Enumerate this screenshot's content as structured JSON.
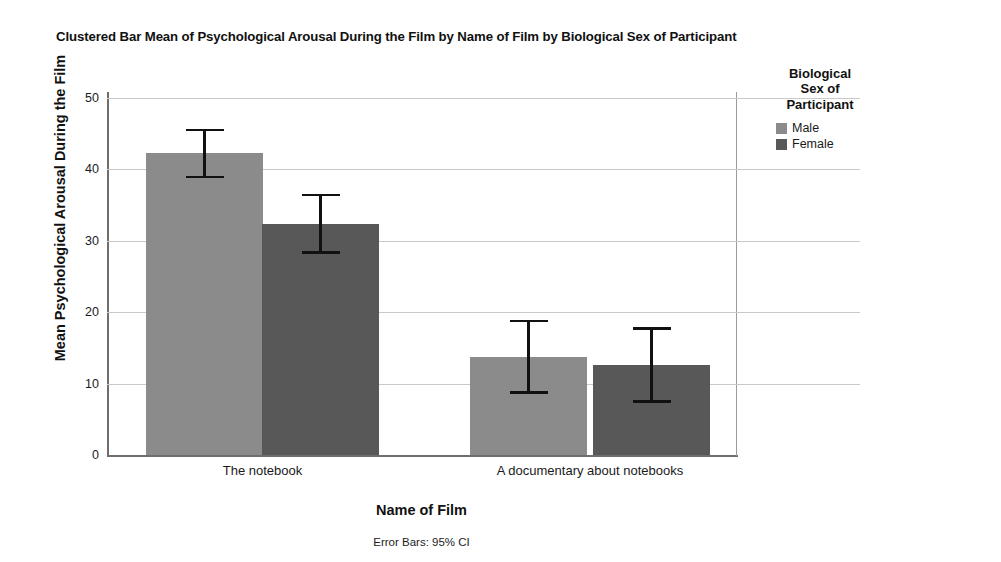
{
  "chart_data": {
    "type": "bar",
    "title": "Clustered Bar Mean of Psychological Arousal During the Film by Name of Film by Biological Sex of Participant",
    "xlabel": "Name of Film",
    "ylabel": "Mean Psychological Arousal During the Film",
    "footnote": "Error Bars: 95% CI",
    "categories": [
      "The notebook",
      "A documentary about notebooks"
    ],
    "ylim": [
      0,
      50
    ],
    "yticks": [
      0,
      10,
      20,
      30,
      40,
      50
    ],
    "ytick_labels": [
      "0",
      "10",
      "20",
      "30",
      "40",
      "50"
    ],
    "grid": true,
    "legend_position": "right",
    "legend_title": "Biological Sex of Participant",
    "series": [
      {
        "name": "Male",
        "color": "#8b8b8b",
        "values": [
          42.3,
          13.7
        ],
        "ci_low": [
          38.8,
          8.6
        ],
        "ci_high": [
          45.7,
          18.9
        ]
      },
      {
        "name": "Female",
        "color": "#585858",
        "values": [
          32.4,
          12.6
        ],
        "ci_low": [
          28.2,
          7.3
        ],
        "ci_high": [
          36.6,
          17.9
        ]
      }
    ]
  },
  "legend": {
    "title_lines": [
      "Biological",
      "Sex of",
      "Participant"
    ],
    "items": [
      {
        "label": "Male",
        "color": "#8b8b8b"
      },
      {
        "label": "Female",
        "color": "#585858"
      }
    ]
  }
}
